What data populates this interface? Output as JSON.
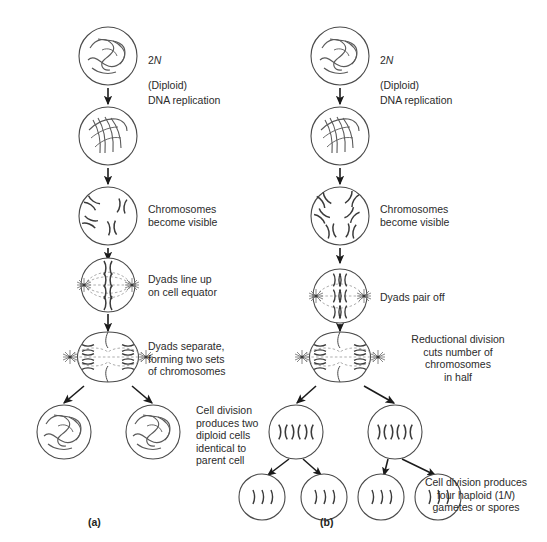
{
  "figure": {
    "background_color": "#ffffff",
    "line_color": "#4a4a4a",
    "text_color": "#2b2b2b",
    "width": 547,
    "height": 542
  },
  "panels": [
    {
      "tag": "(a)",
      "name": "mitosis",
      "tag_x": 88,
      "tag_y": 522,
      "stages": [
        {
          "name": "interphase-diploid",
          "cell_type": "tangled-chromatin",
          "cx": 108,
          "cy": 56,
          "r": 29,
          "label": "2N\n(Diploid)",
          "label_x": 148,
          "label_y": 47,
          "label_align": "left",
          "has_italic_n": true
        },
        {
          "name": "after-dna-replication",
          "cell_type": "replicated-chromatin",
          "cx": 108,
          "cy": 136,
          "r": 29,
          "label": "DNA replication",
          "label_x": 148,
          "label_y": 94,
          "label_align": "left",
          "has_italic_n": false
        },
        {
          "name": "prophase-chromosomes-visible",
          "cell_type": "four-dyads-scattered",
          "cx": 108,
          "cy": 216,
          "r": 29,
          "label": "Chromosomes\nbecome visible",
          "label_x": 148,
          "label_y": 203,
          "label_align": "left",
          "has_italic_n": false
        },
        {
          "name": "metaphase-equator",
          "cell_type": "dyads-on-equator-spindle",
          "cx": 108,
          "cy": 285,
          "r": 27,
          "label": "Dyads line up\non cell equator",
          "label_x": 148,
          "label_y": 273,
          "label_align": "left",
          "has_italic_n": false
        },
        {
          "name": "anaphase-separation",
          "cell_type": "dumbbell-separating",
          "cx": 108,
          "cy": 357,
          "r": 26,
          "label": "Dyads separate,\nforming two sets\nof chromosomes",
          "label_x": 148,
          "label_y": 340,
          "label_align": "left",
          "has_italic_n": false
        },
        {
          "name": "daughter-cell-left",
          "cell_type": "tangled-chromatin",
          "cx": 64,
          "cy": 432,
          "r": 27,
          "label": "",
          "label_x": 0,
          "label_y": 0,
          "label_align": "left",
          "has_italic_n": false
        },
        {
          "name": "daughter-cell-right",
          "cell_type": "tangled-chromatin",
          "cx": 153,
          "cy": 432,
          "r": 27,
          "label": "Cell division\nproduces two\ndiploid cells\nidentical to\nparent cell",
          "label_x": 196,
          "label_y": 404,
          "label_align": "left",
          "has_italic_n": false
        }
      ]
    },
    {
      "tag": "(b)",
      "name": "meiosis",
      "tag_x": 320,
      "tag_y": 522,
      "stages": [
        {
          "name": "interphase-diploid",
          "cell_type": "tangled-chromatin",
          "cx": 340,
          "cy": 56,
          "r": 29,
          "label": "2N\n(Diploid)",
          "label_x": 380,
          "label_y": 47,
          "label_align": "left",
          "has_italic_n": true
        },
        {
          "name": "after-dna-replication",
          "cell_type": "replicated-chromatin",
          "cx": 340,
          "cy": 136,
          "r": 29,
          "label": "DNA replication",
          "label_x": 380,
          "label_y": 94,
          "label_align": "left",
          "has_italic_n": false
        },
        {
          "name": "prophase-chromosomes-visible",
          "cell_type": "six-dyads-scattered",
          "cx": 340,
          "cy": 216,
          "r": 29,
          "label": "Chromosomes\nbecome visible",
          "label_x": 380,
          "label_y": 203,
          "label_align": "left",
          "has_italic_n": false
        },
        {
          "name": "metaphase-i-pairing",
          "cell_type": "tetrads-paired-equator",
          "cx": 340,
          "cy": 296,
          "r": 27,
          "label": "Dyads pair off",
          "label_x": 380,
          "label_y": 291,
          "label_align": "left",
          "has_italic_n": false
        },
        {
          "name": "anaphase-i-reductional",
          "cell_type": "dumbbell-separating",
          "cx": 340,
          "cy": 357,
          "r": 26,
          "label": "Reductional division\ncuts number of\nchromosomes\nin half",
          "label_x": 378,
          "label_y": 337,
          "label_align": "center",
          "has_italic_n": false
        },
        {
          "name": "secondary-cell-left",
          "cell_type": "three-dyads-row",
          "cx": 296,
          "cy": 432,
          "r": 27,
          "label": "",
          "label_x": 0,
          "label_y": 0,
          "label_align": "left",
          "has_italic_n": false
        },
        {
          "name": "secondary-cell-right",
          "cell_type": "three-dyads-row",
          "cx": 395,
          "cy": 432,
          "r": 27,
          "label": "",
          "label_x": 0,
          "label_y": 0,
          "label_align": "left",
          "has_italic_n": false
        },
        {
          "name": "gamete-1",
          "cell_type": "three-monads-row",
          "cx": 262,
          "cy": 497,
          "r": 23,
          "label": "",
          "label_x": 0,
          "label_y": 0,
          "label_align": "left",
          "has_italic_n": false
        },
        {
          "name": "gamete-2",
          "cell_type": "three-monads-row",
          "cx": 324,
          "cy": 497,
          "r": 23,
          "label": "",
          "label_x": 0,
          "label_y": 0,
          "label_align": "left",
          "has_italic_n": false
        },
        {
          "name": "gamete-3",
          "cell_type": "three-monads-row",
          "cx": 381,
          "cy": 497,
          "r": 23,
          "label": "",
          "label_x": 0,
          "label_y": 0,
          "label_align": "left",
          "has_italic_n": false
        },
        {
          "name": "gamete-4",
          "cell_type": "three-monads-row",
          "cx": 438,
          "cy": 497,
          "r": 23,
          "label": "Cell division produces\nfour haploid (1N)\ngametes or spores",
          "label_x": 471,
          "label_y": 479,
          "label_align": "left",
          "has_italic_n": true
        }
      ]
    }
  ],
  "labels": {
    "diploid_2n": "2N",
    "diploid_word": "(Diploid)",
    "dna_replication": "DNA replication",
    "chromosomes_become_visible": "Chromosomes\nbecome visible",
    "dyads_line_up": "Dyads line up\non cell equator",
    "dyads_separate": "Dyads separate,\nforming two sets\nof chromosomes",
    "cell_division_two_diploid": "Cell division\nproduces two\ndiploid cells\nidentical to\nparent cell",
    "dyads_pair_off": "Dyads pair off",
    "reductional_division": "Reductional division\ncuts number of\nchromosomes\nin half",
    "four_haploid": "Cell division produces\nfour haploid (1N)\ngametes or spores",
    "panel_a": "(a)",
    "panel_b": "(b)"
  }
}
